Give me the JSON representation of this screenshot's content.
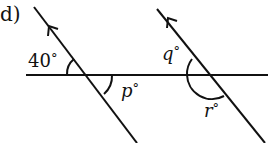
{
  "part_label": "d)",
  "angles": {
    "given": {
      "value": "40",
      "unit": "°",
      "text": "40°"
    },
    "p": {
      "name": "p",
      "unit": "°"
    },
    "q": {
      "name": "q",
      "unit": "°"
    },
    "r": {
      "name": "r",
      "unit": "°"
    }
  },
  "colors": {
    "ink": "#111111",
    "background": "#ffffff"
  }
}
